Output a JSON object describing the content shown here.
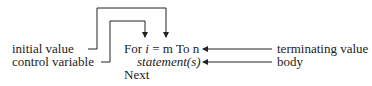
{
  "labels": {
    "initial_value": "initial value",
    "control_variable": "control variable",
    "terminating_value": "terminating value",
    "body": "body"
  },
  "code": {
    "line1_for": "For ",
    "line1_var": "i",
    "line1_eq": " = ",
    "line1_start": "m",
    "line1_to": " To n",
    "line2": "statement(s)",
    "line3": "Next"
  }
}
